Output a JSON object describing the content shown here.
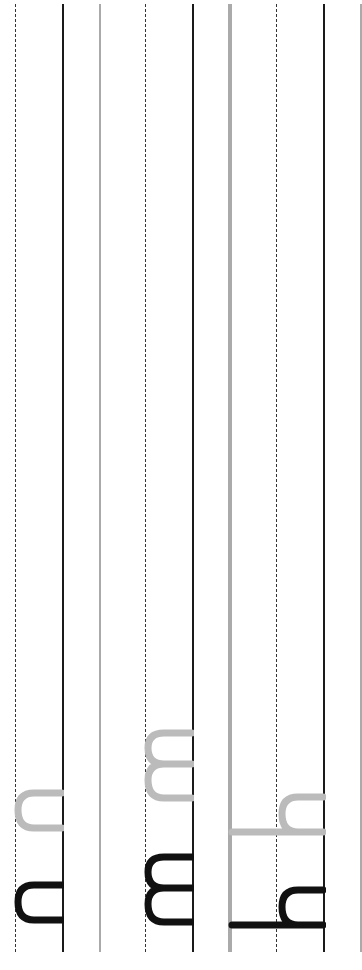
{
  "worksheet": {
    "orientation": "rotated-90",
    "rows": [
      {
        "letter": "n",
        "model_color": "#111111",
        "trace_color": "#bbbbbb"
      },
      {
        "letter": "m",
        "model_color": "#111111",
        "trace_color": "#bbbbbb"
      },
      {
        "letter": "h",
        "model_color": "#111111",
        "trace_color": "#bbbbbb"
      }
    ],
    "line_colors": {
      "baseline": "#1a1a1a",
      "midline_dashed": "#333333",
      "top_line": "#aaaaaa"
    }
  }
}
